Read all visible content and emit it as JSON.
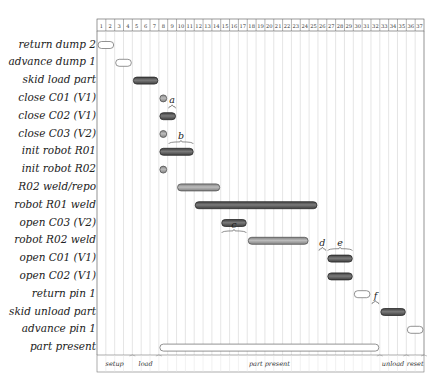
{
  "chart_data": {
    "type": "gantt",
    "title": "",
    "xlabel": "",
    "ylabel": "",
    "columns": [
      1,
      2,
      3,
      4,
      5,
      6,
      7,
      8,
      9,
      10,
      11,
      12,
      13,
      14,
      15,
      16,
      17,
      18,
      19,
      20,
      21,
      22,
      23,
      24,
      25,
      26,
      27,
      28,
      29,
      30,
      31,
      32,
      33,
      34,
      35,
      36,
      37
    ],
    "grid": true,
    "colors": {
      "dark": "#5a5a5a",
      "medium": "#9a9a9a",
      "empty": "#ffffff",
      "outline": "#444444"
    },
    "tasks": [
      {
        "label": "return dump 2",
        "start": 1,
        "end": 2,
        "style": "empty"
      },
      {
        "label": "advance dump 1",
        "start": 3,
        "end": 4,
        "style": "empty"
      },
      {
        "label": "skid load part",
        "start": 5,
        "end": 7,
        "style": "dark"
      },
      {
        "label": "close C01 (V1)",
        "start": 8,
        "end": 8,
        "style": "medium"
      },
      {
        "label": "close C02 (V1)",
        "start": 8,
        "end": 9,
        "style": "dark"
      },
      {
        "label": "close C03 (V2)",
        "start": 8,
        "end": 8,
        "style": "medium"
      },
      {
        "label": "init robot R01",
        "start": 8,
        "end": 11,
        "style": "dark"
      },
      {
        "label": "init robot R02",
        "start": 8,
        "end": 8,
        "style": "medium"
      },
      {
        "label": "R02 weld/repo",
        "start": 10,
        "end": 14,
        "style": "medium"
      },
      {
        "label": "robot R01 weld",
        "start": 12,
        "end": 25,
        "style": "dark"
      },
      {
        "label": "open C03 (V2)",
        "start": 15,
        "end": 17,
        "style": "dark"
      },
      {
        "label": "robot R02 weld",
        "start": 18,
        "end": 24,
        "style": "medium"
      },
      {
        "label": "open C01 (V1)",
        "start": 27,
        "end": 29,
        "style": "dark"
      },
      {
        "label": "open C02 (V1)",
        "start": 27,
        "end": 29,
        "style": "dark"
      },
      {
        "label": "return pin 1",
        "start": 30,
        "end": 31,
        "style": "empty"
      },
      {
        "label": "skid unload part",
        "start": 33,
        "end": 35,
        "style": "dark"
      },
      {
        "label": "advance pin 1",
        "start": 36,
        "end": 37,
        "style": "empty"
      },
      {
        "label": "part present",
        "start": 8,
        "end": 32,
        "style": "empty"
      }
    ],
    "annotations": [
      {
        "text": "a",
        "row": 3,
        "col_from": 9,
        "col_to": 9
      },
      {
        "text": "b",
        "row": 5,
        "col_from": 9,
        "col_to": 11
      },
      {
        "text": "c",
        "row": 10,
        "col_from": 15,
        "col_to": 17
      },
      {
        "text": "d",
        "row": 11,
        "col_from": 26,
        "col_to": 26
      },
      {
        "text": "e",
        "row": 11,
        "col_from": 27,
        "col_to": 29
      },
      {
        "text": "f",
        "row": 14,
        "col_from": 32,
        "col_to": 32
      }
    ],
    "phases": [
      {
        "label": "setup",
        "start": 1,
        "end": 4
      },
      {
        "label": "load",
        "start": 5,
        "end": 7
      },
      {
        "label": "part present",
        "start": 8,
        "end": 32
      },
      {
        "label": "unload",
        "start": 33,
        "end": 35
      },
      {
        "label": "reset",
        "start": 36,
        "end": 37
      }
    ]
  }
}
